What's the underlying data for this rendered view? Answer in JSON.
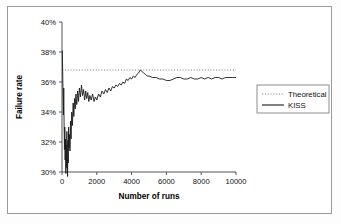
{
  "figure": {
    "border_color": "#9a9a9a",
    "background": "#ffffff"
  },
  "chart_data": {
    "type": "line",
    "title": "",
    "xlabel": "Number of runs",
    "ylabel": "Failure rate",
    "xlim": [
      0,
      10000
    ],
    "ylim": [
      0.3,
      0.4
    ],
    "grid": false,
    "legend_position": "right",
    "xticks": [
      0,
      2000,
      4000,
      6000,
      8000,
      10000
    ],
    "xticklabels": [
      "0",
      "2000",
      "4000",
      "6000",
      "8000",
      "10000"
    ],
    "yticks": [
      0.3,
      0.32,
      0.34,
      0.36,
      0.38,
      0.4
    ],
    "yticklabels": [
      "30%",
      "32%",
      "34%",
      "36%",
      "38%",
      "40%"
    ],
    "series": [
      {
        "name": "Theoretical",
        "style": "dotted",
        "color": "#8a8a8a",
        "constant_value": 0.368,
        "x": [
          0,
          10000
        ],
        "values": [
          0.368,
          0.368
        ]
      },
      {
        "name": "KISS",
        "style": "solid",
        "color": "#1a1a1a",
        "x": [
          20,
          40,
          60,
          80,
          100,
          120,
          140,
          160,
          180,
          200,
          220,
          240,
          260,
          280,
          300,
          320,
          340,
          360,
          380,
          400,
          430,
          460,
          490,
          520,
          560,
          600,
          640,
          680,
          720,
          760,
          800,
          850,
          900,
          950,
          1000,
          1060,
          1120,
          1180,
          1240,
          1300,
          1360,
          1420,
          1480,
          1540,
          1600,
          1680,
          1760,
          1840,
          1920,
          2000,
          2100,
          2200,
          2300,
          2400,
          2500,
          2600,
          2700,
          2800,
          2900,
          3000,
          3100,
          3200,
          3300,
          3400,
          3500,
          3600,
          3700,
          3800,
          3900,
          4000,
          4100,
          4200,
          4300,
          4400,
          4500,
          4600,
          4700,
          4800,
          4900,
          5000,
          5200,
          5400,
          5600,
          5800,
          6000,
          6200,
          6400,
          6600,
          6800,
          7000,
          7200,
          7400,
          7600,
          7800,
          8000,
          8200,
          8400,
          8600,
          8800,
          9000,
          9200,
          9400,
          9600,
          9800,
          10000
        ],
        "values": [
          0.381,
          0.366,
          0.352,
          0.338,
          0.356,
          0.333,
          0.315,
          0.33,
          0.308,
          0.322,
          0.299,
          0.318,
          0.303,
          0.327,
          0.311,
          0.297,
          0.321,
          0.306,
          0.33,
          0.316,
          0.325,
          0.314,
          0.334,
          0.322,
          0.34,
          0.331,
          0.346,
          0.337,
          0.349,
          0.342,
          0.352,
          0.345,
          0.354,
          0.347,
          0.356,
          0.35,
          0.358,
          0.351,
          0.355,
          0.348,
          0.354,
          0.349,
          0.353,
          0.347,
          0.351,
          0.348,
          0.352,
          0.347,
          0.35,
          0.348,
          0.352,
          0.35,
          0.354,
          0.352,
          0.355,
          0.353,
          0.356,
          0.354,
          0.357,
          0.356,
          0.358,
          0.357,
          0.359,
          0.358,
          0.36,
          0.359,
          0.362,
          0.361,
          0.363,
          0.362,
          0.364,
          0.363,
          0.365,
          0.366,
          0.368,
          0.367,
          0.366,
          0.365,
          0.364,
          0.364,
          0.363,
          0.363,
          0.362,
          0.362,
          0.361,
          0.361,
          0.362,
          0.363,
          0.363,
          0.362,
          0.362,
          0.363,
          0.362,
          0.362,
          0.363,
          0.362,
          0.363,
          0.362,
          0.363,
          0.363,
          0.362,
          0.363,
          0.363,
          0.363,
          0.363
        ]
      }
    ]
  }
}
